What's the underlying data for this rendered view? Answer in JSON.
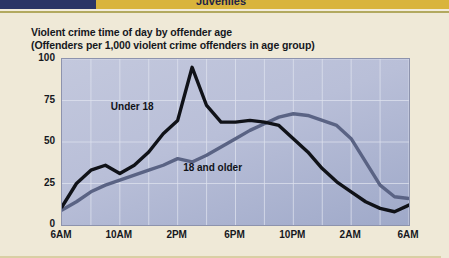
{
  "banner": {
    "section_title": "Juveniles",
    "navy_color": "#2b3566",
    "gold_color": "#d9b43c"
  },
  "chart_data": {
    "type": "line",
    "title": "Violent crime time of day by offender age",
    "subtitle": "(Offenders per 1,000 violent crime offenders in age group)",
    "xlabel": "",
    "ylabel": "",
    "ylim": [
      0,
      100
    ],
    "yticks": [
      0,
      25,
      50,
      75,
      100
    ],
    "xticks": [
      "6AM",
      "10AM",
      "2PM",
      "6PM",
      "10PM",
      "2AM",
      "6AM"
    ],
    "grid": true,
    "legend": "inline-labels",
    "x": [
      "6AM",
      "7AM",
      "8AM",
      "9AM",
      "10AM",
      "11AM",
      "12PM",
      "1PM",
      "2PM",
      "3PM",
      "4PM",
      "5PM",
      "6PM",
      "7PM",
      "8PM",
      "9PM",
      "10PM",
      "11PM",
      "12AM",
      "1AM",
      "2AM",
      "3AM",
      "4AM",
      "5AM",
      "6AM"
    ],
    "series": [
      {
        "name": "Under 18",
        "color": "#101218",
        "values": [
          11,
          25,
          33,
          36,
          31,
          36,
          44,
          55,
          63,
          95,
          72,
          62,
          62,
          63,
          62,
          60,
          52,
          44,
          34,
          26,
          20,
          14,
          10,
          8,
          12
        ]
      },
      {
        "name": "18 and older",
        "color": "#5a6384",
        "values": [
          9,
          14,
          20,
          24,
          27,
          30,
          33,
          36,
          40,
          38,
          42,
          47,
          52,
          57,
          61,
          65,
          67,
          66,
          63,
          60,
          52,
          38,
          24,
          17,
          16
        ]
      }
    ],
    "annotations": [
      {
        "text": "Under 18",
        "x": "10AM",
        "y": 70
      },
      {
        "text": "18 and older",
        "x": "3PM",
        "y": 33
      }
    ]
  }
}
